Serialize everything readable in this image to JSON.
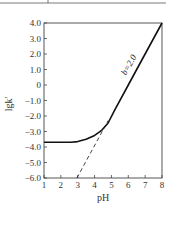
{
  "chart_data": {
    "type": "line",
    "title": "",
    "xlabel": "pH",
    "ylabel": "lgk'",
    "xlim": [
      1,
      8
    ],
    "ylim": [
      -6.0,
      4.0
    ],
    "x_ticks": [
      "1",
      "2",
      "3",
      "4",
      "5",
      "6",
      "7",
      "8"
    ],
    "y_ticks": [
      "4.0",
      "3.0",
      "2.0",
      "1.0",
      "0",
      "-1.0",
      "-2.0",
      "-3.0",
      "-4.0",
      "-5.0",
      "-6.0"
    ],
    "grid": false,
    "legend": null,
    "series": [
      {
        "name": "lgk' (solid)",
        "style": "solid",
        "x": [
          1.0,
          2.0,
          2.6,
          3.0,
          3.5,
          4.0,
          4.4,
          4.8,
          5.2,
          6.0,
          7.0,
          8.0
        ],
        "y": [
          -3.7,
          -3.7,
          -3.7,
          -3.65,
          -3.5,
          -3.25,
          -2.95,
          -2.45,
          -1.6,
          0.0,
          2.0,
          4.0
        ]
      },
      {
        "name": "asymptote (dashed)",
        "style": "dashed",
        "x": [
          2.95,
          4.8
        ],
        "y": [
          -6.0,
          -2.3
        ]
      }
    ],
    "annotations": [
      {
        "text": "b=2.0",
        "x": 6.3,
        "y": 1.2,
        "rotation": -60
      }
    ]
  }
}
